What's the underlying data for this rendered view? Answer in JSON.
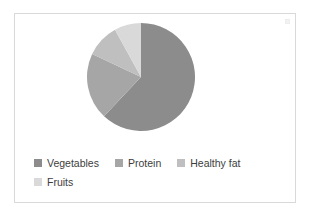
{
  "chart_data": {
    "type": "pie",
    "title": "",
    "categories": [
      "Vegetables",
      "Protein",
      "Healthy fat",
      "Fruits"
    ],
    "values": [
      62,
      20,
      10,
      8
    ],
    "colors": [
      "#8c8c8c",
      "#a6a6a6",
      "#bfbfbf",
      "#d9d9d9"
    ],
    "start_angle": 0,
    "direction": "clockwise",
    "legend_position": "bottom",
    "grid": false,
    "data_labels": false
  },
  "frame": {
    "border_color": "#d9d9d9",
    "background": "#ffffff"
  },
  "legend": {
    "rows": [
      [
        {
          "label": "Vegetables",
          "color": "#8c8c8c"
        },
        {
          "label": "Protein",
          "color": "#a6a6a6"
        },
        {
          "label": "Healthy fat",
          "color": "#bfbfbf"
        }
      ],
      [
        {
          "label": "Fruits",
          "color": "#d9d9d9"
        }
      ]
    ]
  }
}
